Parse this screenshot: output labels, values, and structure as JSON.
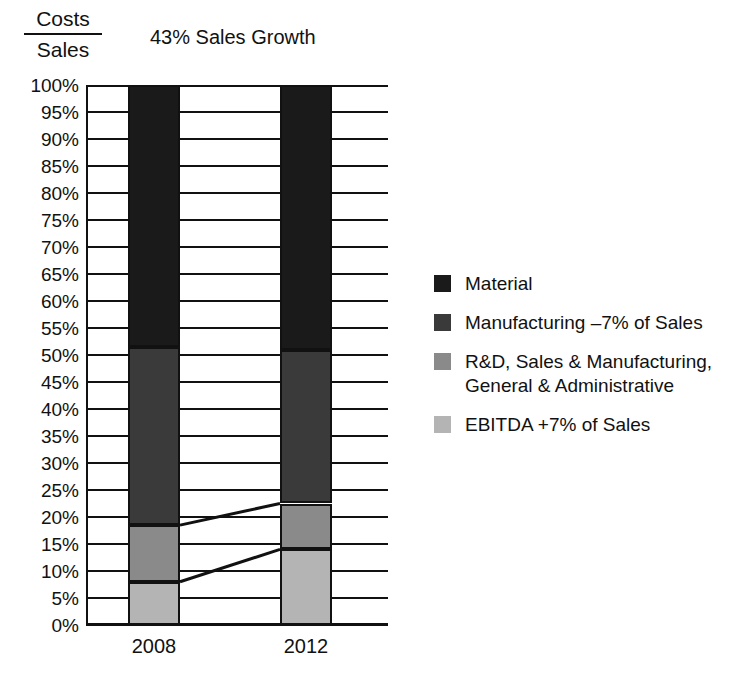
{
  "axis_caption": {
    "numerator": "Costs",
    "denominator": "Sales"
  },
  "legend": {
    "items": [
      {
        "label": "Material",
        "color": "#1a1a1a",
        "swatch_name": "legend-swatch-material"
      },
      {
        "label": "Manufacturing –7% of Sales",
        "color": "#3a3a3a",
        "swatch_name": "legend-swatch-manufacturing"
      },
      {
        "label": "R&D, Sales & Manufacturing, General & Administrative",
        "color": "#8a8a8a",
        "swatch_name": "legend-swatch-rd"
      },
      {
        "label": "EBITDA +7% of Sales",
        "color": "#b4b4b4",
        "swatch_name": "legend-swatch-ebitda"
      }
    ]
  },
  "chart_data": {
    "type": "bar",
    "stacked": true,
    "title": "43% Sales Growth",
    "xlabel": "",
    "ylabel": "Costs / Sales",
    "ylim": [
      0,
      100
    ],
    "ytick_labels": [
      "100%",
      "95%",
      "90%",
      "85%",
      "80%",
      "75%",
      "70%",
      "65%",
      "60%",
      "55%",
      "50%",
      "45%",
      "40%",
      "35%",
      "30%",
      "25%",
      "20%",
      "15%",
      "10%",
      "5%",
      "0%"
    ],
    "ytick_values": [
      100,
      95,
      90,
      85,
      80,
      75,
      70,
      65,
      60,
      55,
      50,
      45,
      40,
      35,
      30,
      25,
      20,
      15,
      10,
      5,
      0
    ],
    "grid": true,
    "legend_position": "right",
    "categories": [
      "2008",
      "2012"
    ],
    "series": [
      {
        "name": "EBITDA +7% of Sales",
        "values": [
          8,
          14
        ],
        "color": "#b4b4b4"
      },
      {
        "name": "R&D, Sales & Manufacturing, General & Administrative",
        "values": [
          10.5,
          8.5
        ],
        "color": "#8a8a8a"
      },
      {
        "name": "Manufacturing –7% of Sales",
        "values": [
          33,
          28.5
        ],
        "color": "#3a3a3a"
      },
      {
        "name": "Material",
        "values": [
          48.5,
          49
        ],
        "color": "#1a1a1a"
      }
    ],
    "cumulative_boundaries": {
      "2008": {
        "ebitda_top": 8,
        "rd_top": 18.5,
        "manufacturing_top": 51.5,
        "material_top": 100
      },
      "2012": {
        "ebitda_top": 14,
        "rd_top": 22.5,
        "manufacturing_top": 51,
        "material_top": 100
      }
    },
    "annotations": [
      {
        "name": "connector-ebitda",
        "from_year": "2008",
        "from_value": 8,
        "to_year": "2012",
        "to_value": 14
      },
      {
        "name": "connector-rd",
        "from_year": "2008",
        "from_value": 18.5,
        "to_year": "2012",
        "to_value": 22.5
      }
    ]
  }
}
